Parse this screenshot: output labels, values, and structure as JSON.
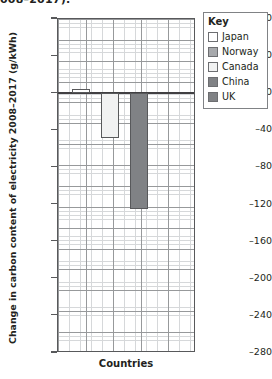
{
  "clipped_title": "008–2017).",
  "axes": {
    "y_title": "Change in carbon content of electricity 2008–2017 (g/kWh)",
    "x_title": "Countries"
  },
  "legend": {
    "title": "Key",
    "items": [
      {
        "label": "Japan",
        "color": "#ffffff"
      },
      {
        "label": "Norway",
        "color": "#a7a9ac"
      },
      {
        "label": "Canada",
        "color": "#f1f2f2"
      },
      {
        "label": "China",
        "color": "#808285"
      },
      {
        "label": "UK",
        "color": "#808285"
      }
    ]
  },
  "chart_data": {
    "type": "bar",
    "title": "Change in carbon content of electricity 2008–2017",
    "xlabel": "Countries",
    "ylabel": "Change in carbon content of electricity 2008–2017 (g/kWh)",
    "ylim": [
      -280,
      80
    ],
    "ytick_values": [
      80,
      40,
      0,
      -40,
      -80,
      -120,
      -160,
      -200,
      -240,
      -280
    ],
    "ytick_labels": [
      "80",
      "40",
      "0",
      "-40",
      "-80",
      "-120",
      "-160",
      "-200",
      "-240",
      "-280"
    ],
    "grid": true,
    "legend_position": "top-right",
    "categories": [
      "Japan",
      "Norway",
      "Canada",
      "China",
      "UK"
    ],
    "values": [
      5,
      null,
      -48,
      -125,
      null
    ],
    "bars_drawn": [
      {
        "name": "Japan",
        "value": 5,
        "color": "#ffffff"
      },
      {
        "name": "Canada",
        "value": -48,
        "color": "#f1f2f2"
      },
      {
        "name": "China",
        "value": -125,
        "color": "#808285"
      }
    ]
  }
}
